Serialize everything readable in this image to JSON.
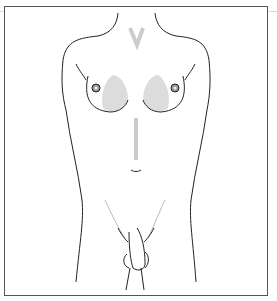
{
  "figure": {
    "type": "anatomical line illustration",
    "colors": {
      "line": "#222222",
      "shade": "#d9d9d9",
      "frame": "#555555"
    }
  }
}
